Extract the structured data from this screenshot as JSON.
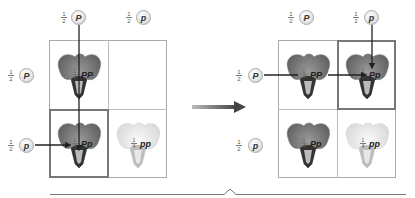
{
  "left_square": {
    "top_alleles": [
      {
        "fraction": {
          "num": "1",
          "den": "2"
        },
        "allele": "P"
      },
      {
        "fraction": {
          "num": "1",
          "den": "2"
        },
        "allele": "p"
      }
    ],
    "side_alleles": [
      {
        "fraction": {
          "num": "1",
          "den": "2"
        },
        "allele": "P"
      },
      {
        "fraction": {
          "num": "1",
          "den": "2"
        },
        "allele": "p"
      }
    ],
    "cells": [
      {
        "fraction": {
          "num": "1",
          "den": "4"
        },
        "genotype": "PP",
        "flower": "purple",
        "visible": true
      },
      {
        "fraction": {
          "num": "",
          "den": ""
        },
        "genotype": "",
        "flower": "none",
        "visible": false
      },
      {
        "fraction": {
          "num": "1",
          "den": "4"
        },
        "genotype": "Pp",
        "flower": "purple",
        "visible": true
      },
      {
        "fraction": {
          "num": "1",
          "den": "4"
        },
        "genotype": "pp",
        "flower": "white",
        "visible": true
      }
    ],
    "highlighted_cell": "Pp"
  },
  "right_square": {
    "top_alleles": [
      {
        "fraction": {
          "num": "1",
          "den": "2"
        },
        "allele": "P"
      },
      {
        "fraction": {
          "num": "1",
          "den": "2"
        },
        "allele": "p"
      }
    ],
    "side_alleles": [
      {
        "fraction": {
          "num": "1",
          "den": "2"
        },
        "allele": "P"
      },
      {
        "fraction": {
          "num": "1",
          "den": "2"
        },
        "allele": "p"
      }
    ],
    "cells": [
      {
        "fraction": {
          "num": "1",
          "den": "4"
        },
        "genotype": "PP",
        "flower": "purple"
      },
      {
        "fraction": {
          "num": "1",
          "den": "4"
        },
        "genotype": "Pp",
        "flower": "purple"
      },
      {
        "fraction": {
          "num": "1",
          "den": "4"
        },
        "genotype": "Pp",
        "flower": "purple"
      },
      {
        "fraction": {
          "num": "1",
          "den": "4"
        },
        "genotype": "pp",
        "flower": "white"
      }
    ],
    "highlighted_cell": "Pp"
  },
  "colors": {
    "grid_border": "#aaaaaa",
    "highlight_border": "#777777",
    "arrow": "#555555",
    "purple_flower": "#6e6e6e",
    "white_flower": "#e6e6e6"
  }
}
